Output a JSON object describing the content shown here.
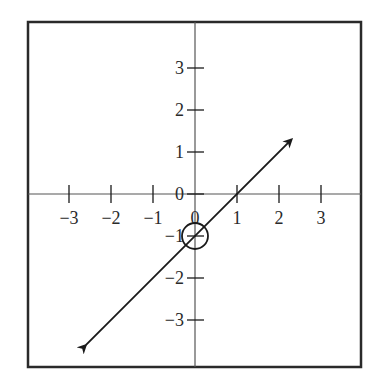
{
  "chart_data": {
    "type": "line",
    "title": "",
    "xlabel": "",
    "ylabel": "",
    "xlim": [
      -4,
      4
    ],
    "ylim": [
      -4,
      4
    ],
    "grid": false,
    "x_ticks": [
      -3,
      -2,
      -1,
      0,
      1,
      2,
      3
    ],
    "y_ticks": [
      3,
      2,
      1,
      0,
      -1,
      -2,
      -3
    ],
    "x_tick_labels": [
      "−3",
      "−2",
      "−1",
      "0",
      "1",
      "2",
      "3"
    ],
    "y_tick_labels": [
      "3",
      "2",
      "1",
      "0",
      "−1",
      "−2",
      "−3"
    ],
    "series": [
      {
        "name": "line",
        "equation": "y = x - 1",
        "slope": 1,
        "y_intercept": -1,
        "x": [
          -2.6,
          2.3
        ],
        "y": [
          -3.6,
          1.3
        ],
        "arrows": "both"
      }
    ],
    "annotations": [
      {
        "type": "circle",
        "x": 0,
        "y": -1,
        "label": "y-intercept"
      }
    ]
  },
  "colors": {
    "ink": "#1a1a1a",
    "axis": "#555555",
    "background": "#ffffff"
  }
}
